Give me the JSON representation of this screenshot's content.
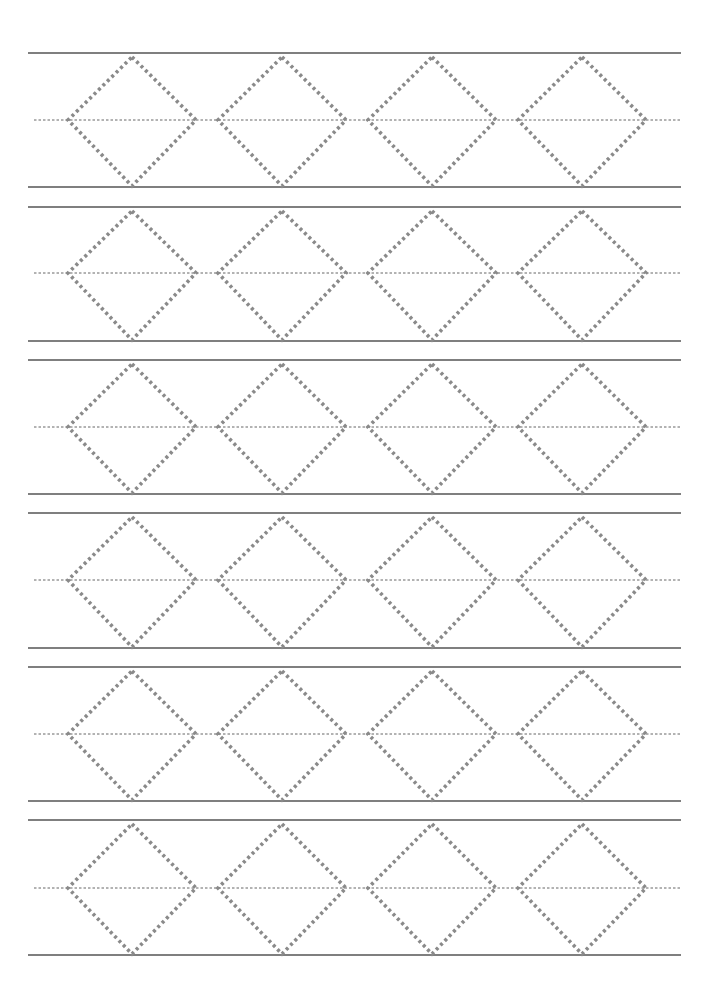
{
  "worksheet": {
    "type": "diamond-shape tracing practice",
    "rows_count": 6,
    "diamonds_per_row": 4,
    "colors": {
      "solid_line": "#555555",
      "dashed_midline": "#666666",
      "dotted_shape": "#8a8a8a",
      "background": "#ffffff"
    },
    "layout": {
      "line_left_x": 28,
      "line_right_x": 681,
      "row_top_lines": [
        53,
        207,
        360,
        513,
        667,
        820
      ],
      "row_mid_lines": [
        120,
        273,
        427,
        580,
        734,
        888
      ],
      "row_bottom_lines": [
        187,
        341,
        494,
        648,
        801,
        955
      ],
      "diamond_center_x": [
        132,
        282,
        432,
        582
      ],
      "diamond_half_width": 64,
      "diamond_top_offset": 4,
      "diamond_bottom_offset": 1
    },
    "rows": [
      {
        "label": "row-1",
        "shapes": [
          "diamond",
          "diamond",
          "diamond",
          "diamond"
        ]
      },
      {
        "label": "row-2",
        "shapes": [
          "diamond",
          "diamond",
          "diamond",
          "diamond"
        ]
      },
      {
        "label": "row-3",
        "shapes": [
          "diamond",
          "diamond",
          "diamond",
          "diamond"
        ]
      },
      {
        "label": "row-4",
        "shapes": [
          "diamond",
          "diamond",
          "diamond",
          "diamond"
        ]
      },
      {
        "label": "row-5",
        "shapes": [
          "diamond",
          "diamond",
          "diamond",
          "diamond"
        ]
      },
      {
        "label": "row-6",
        "shapes": [
          "diamond",
          "diamond",
          "diamond",
          "diamond"
        ]
      }
    ]
  }
}
